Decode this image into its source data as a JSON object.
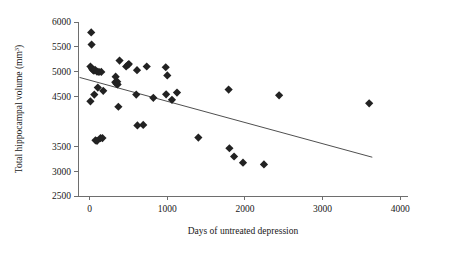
{
  "chart_data": {
    "type": "scatter",
    "title": "",
    "xlabel": "Days of untreated  depression",
    "ylabel": "Total hippocampal volume (mm",
    "ylabel_sup": "3",
    "ylabel_suffix": ")",
    "xlim": [
      -150,
      4100
    ],
    "ylim": [
      2500,
      6000
    ],
    "xticks": [
      0,
      1000,
      2000,
      3000,
      4000
    ],
    "xtick_labels": [
      "0",
      "1000",
      "2000",
      "3000",
      "4000"
    ],
    "yticks": [
      2500,
      3000,
      3500,
      4500,
      5000,
      5500,
      6000
    ],
    "ytick_labels": [
      "2500",
      "3000",
      "3500",
      "4500",
      "5000",
      "5500",
      "6000"
    ],
    "grid": false,
    "legend": "none",
    "marker": "filled-diamond",
    "marker_color": "#222222",
    "axis_color": "#6e6e6e",
    "points": [
      [
        20,
        5790
      ],
      [
        25,
        5545
      ],
      [
        10,
        5105
      ],
      [
        30,
        5060
      ],
      [
        45,
        5030
      ],
      [
        55,
        5020
      ],
      [
        70,
        5040
      ],
      [
        95,
        5000
      ],
      [
        120,
        4995
      ],
      [
        150,
        4995
      ],
      [
        10,
        4405
      ],
      [
        60,
        4540
      ],
      [
        105,
        4680
      ],
      [
        175,
        4615
      ],
      [
        75,
        3620
      ],
      [
        95,
        3610
      ],
      [
        140,
        3665
      ],
      [
        165,
        3665
      ],
      [
        330,
        4790
      ],
      [
        335,
        4900
      ],
      [
        345,
        4760
      ],
      [
        355,
        4800
      ],
      [
        360,
        4745
      ],
      [
        385,
        5225
      ],
      [
        470,
        5105
      ],
      [
        495,
        5140
      ],
      [
        505,
        5155
      ],
      [
        370,
        4295
      ],
      [
        610,
        5030
      ],
      [
        600,
        4540
      ],
      [
        615,
        3920
      ],
      [
        690,
        3930
      ],
      [
        735,
        5105
      ],
      [
        820,
        4475
      ],
      [
        980,
        5090
      ],
      [
        1000,
        4925
      ],
      [
        985,
        4545
      ],
      [
        1060,
        4435
      ],
      [
        1125,
        4580
      ],
      [
        1400,
        3675
      ],
      [
        1790,
        4640
      ],
      [
        1800,
        3460
      ],
      [
        1860,
        3295
      ],
      [
        1975,
        3170
      ],
      [
        2245,
        3135
      ],
      [
        2440,
        4525
      ],
      [
        3600,
        4365
      ]
    ],
    "trend_line": {
      "x0": -130,
      "y0": 4885,
      "x1": 3640,
      "y1": 3280,
      "style": "solid"
    }
  }
}
